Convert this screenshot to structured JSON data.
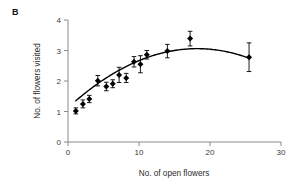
{
  "figure": {
    "panel_label": "B",
    "background_color": "#ffffff"
  },
  "chart_data": {
    "type": "scatter",
    "title": "",
    "subtitle": "",
    "xlabel": "No. of open flowers",
    "ylabel": "No. of flowers visited",
    "xlim": [
      0,
      30
    ],
    "ylim": [
      0,
      4
    ],
    "xticks": [
      0,
      10,
      20,
      30
    ],
    "yticks": [
      0,
      1,
      2,
      3,
      4
    ],
    "xtick_labels": [
      "0",
      "10",
      "20",
      "30"
    ],
    "ytick_labels": [
      "0",
      "1",
      "2",
      "3",
      "4"
    ],
    "grid": false,
    "legend": null,
    "marker": "filled-diamond",
    "marker_color": "#000000",
    "errorbar_color": "#000000",
    "errorbar_style": "vertical-capped",
    "axis_color": "#8a8a8a",
    "curve": {
      "label": "fitted quadratic",
      "color": "#000000",
      "style": "solid",
      "x_start": 1.1,
      "x_end": 25.6,
      "peak_x": 18.2,
      "peak_y": 3.06,
      "coefficients": {
        "a": -0.00585,
        "b": 0.2129,
        "c": 1.1237
      }
    },
    "points": [
      {
        "x": 1.1,
        "y": 1.02,
        "yerr_low": 0.1,
        "yerr_high": 0.1
      },
      {
        "x": 2.1,
        "y": 1.25,
        "yerr_low": 0.13,
        "yerr_high": 0.13
      },
      {
        "x": 3.0,
        "y": 1.41,
        "yerr_low": 0.12,
        "yerr_high": 0.12
      },
      {
        "x": 4.2,
        "y": 2.01,
        "yerr_low": 0.17,
        "yerr_high": 0.17
      },
      {
        "x": 5.4,
        "y": 1.82,
        "yerr_low": 0.14,
        "yerr_high": 0.14
      },
      {
        "x": 6.3,
        "y": 1.91,
        "yerr_low": 0.13,
        "yerr_high": 0.13
      },
      {
        "x": 7.2,
        "y": 2.2,
        "yerr_low": 0.25,
        "yerr_high": 0.25
      },
      {
        "x": 8.2,
        "y": 2.1,
        "yerr_low": 0.15,
        "yerr_high": 0.15
      },
      {
        "x": 9.3,
        "y": 2.63,
        "yerr_low": 0.17,
        "yerr_high": 0.17
      },
      {
        "x": 10.2,
        "y": 2.55,
        "yerr_low": 0.28,
        "yerr_high": 0.28
      },
      {
        "x": 11.1,
        "y": 2.86,
        "yerr_low": 0.14,
        "yerr_high": 0.14
      },
      {
        "x": 14.0,
        "y": 2.98,
        "yerr_low": 0.22,
        "yerr_high": 0.22
      },
      {
        "x": 17.2,
        "y": 3.39,
        "yerr_low": 0.24,
        "yerr_high": 0.24
      },
      {
        "x": 25.5,
        "y": 2.78,
        "yerr_low": 0.47,
        "yerr_high": 0.47
      }
    ]
  }
}
